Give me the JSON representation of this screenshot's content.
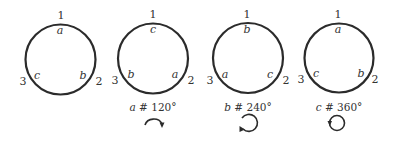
{
  "diagrams": [
    {
      "positions": {
        "p1": "1",
        "p2": "2",
        "p3": "3"
      },
      "labels": {
        "top": "a",
        "right": "b",
        "left": "c"
      },
      "caption": null,
      "rotation": null
    },
    {
      "positions": {
        "p1": "1",
        "p2": "2",
        "p3": "3"
      },
      "labels": {
        "top": "c",
        "right": "a",
        "left": "b"
      },
      "caption": {
        "var": "a",
        "op": "#",
        "angle": "120°"
      },
      "rotation": "clockwise-partial-arc"
    },
    {
      "positions": {
        "p1": "1",
        "p2": "2",
        "p3": "3"
      },
      "labels": {
        "top": "b",
        "right": "c",
        "left": "a"
      },
      "caption": {
        "var": "b",
        "op": "#",
        "angle": "240°"
      },
      "rotation": "clockwise-two-thirds-loop"
    },
    {
      "positions": {
        "p1": "1",
        "p2": "2",
        "p3": "3"
      },
      "labels": {
        "top": "a",
        "right": "b",
        "left": "c"
      },
      "caption": {
        "var": "c",
        "op": "#",
        "angle": "360°"
      },
      "rotation": "clockwise-full-loop"
    }
  ],
  "colors": {
    "stroke": "#2b2b2b",
    "text": "#333333",
    "background": "#ffffff"
  }
}
